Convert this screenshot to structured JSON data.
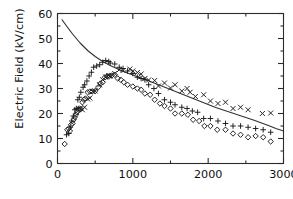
{
  "chart_data": {
    "type": "scatter",
    "title": "",
    "xlabel": "",
    "ylabel": "Electric Field (kV/cm)",
    "xlim": [
      0,
      3000
    ],
    "ylim": [
      0,
      60
    ],
    "xticks": [
      0,
      1000,
      2000,
      3000
    ],
    "xtick_labels": [
      "0",
      "1000",
      "2000",
      "3000"
    ],
    "xminor_ticks": [
      500,
      1500,
      2500
    ],
    "yticks": [
      0,
      10,
      20,
      30,
      40,
      50,
      60
    ],
    "ytick_labels": [
      "0",
      "10",
      "20",
      "30",
      "40",
      "50",
      "60"
    ],
    "yminor_ticks": [
      5,
      15,
      25,
      35,
      45,
      55
    ],
    "grid": false,
    "legend": "none",
    "frame": "box-with-ticks-all-sides",
    "series": [
      {
        "name": "cross-series",
        "marker": "x",
        "color": "#1a1a1a",
        "points": [
          [
            300,
            22.0
          ],
          [
            330,
            21.5
          ],
          [
            360,
            22.5
          ],
          [
            400,
            25.8
          ],
          [
            430,
            26.2
          ],
          [
            470,
            28.8
          ],
          [
            500,
            29.0
          ],
          [
            560,
            31.5
          ],
          [
            600,
            33.5
          ],
          [
            640,
            34.6
          ],
          [
            680,
            35.2
          ],
          [
            700,
            35.0
          ],
          [
            760,
            36.0
          ],
          [
            820,
            37.5
          ],
          [
            870,
            37.2
          ],
          [
            960,
            37.8
          ],
          [
            1000,
            37.0
          ],
          [
            1060,
            36.4
          ],
          [
            1110,
            35.8
          ],
          [
            1160,
            34.0
          ],
          [
            1210,
            33.4
          ],
          [
            1290,
            33.2
          ],
          [
            1340,
            31.0
          ],
          [
            1420,
            32.2
          ],
          [
            1500,
            30.2
          ],
          [
            1560,
            31.5
          ],
          [
            1650,
            29.0
          ],
          [
            1720,
            30.0
          ],
          [
            1760,
            28.5
          ],
          [
            1830,
            26.8
          ],
          [
            1940,
            27.5
          ],
          [
            2030,
            25.0
          ],
          [
            2130,
            24.0
          ],
          [
            2230,
            24.5
          ],
          [
            2330,
            22.0
          ],
          [
            2430,
            22.5
          ],
          [
            2530,
            21.5
          ],
          [
            2720,
            20.0
          ],
          [
            2830,
            20.2
          ]
        ]
      },
      {
        "name": "plus-series",
        "marker": "+",
        "color": "#1a1a1a",
        "points": [
          [
            120,
            11.5
          ],
          [
            150,
            12.0
          ],
          [
            170,
            14.5
          ],
          [
            190,
            17.0
          ],
          [
            210,
            19.0
          ],
          [
            230,
            21.5
          ],
          [
            250,
            22.0
          ],
          [
            270,
            25.5
          ],
          [
            290,
            26.5
          ],
          [
            310,
            28.5
          ],
          [
            340,
            30.5
          ],
          [
            360,
            31.5
          ],
          [
            390,
            33.0
          ],
          [
            420,
            35.0
          ],
          [
            450,
            36.5
          ],
          [
            480,
            38.5
          ],
          [
            520,
            39.0
          ],
          [
            560,
            39.5
          ],
          [
            600,
            40.5
          ],
          [
            640,
            41.2
          ],
          [
            680,
            40.8
          ],
          [
            700,
            40.2
          ],
          [
            760,
            39.8
          ],
          [
            820,
            38.5
          ],
          [
            870,
            38.0
          ],
          [
            930,
            37.0
          ],
          [
            1000,
            36.0
          ],
          [
            1060,
            34.5
          ],
          [
            1110,
            34.0
          ],
          [
            1160,
            33.5
          ],
          [
            1210,
            31.5
          ],
          [
            1280,
            30.0
          ],
          [
            1340,
            28.0
          ],
          [
            1420,
            25.5
          ],
          [
            1500,
            24.5
          ],
          [
            1560,
            23.5
          ],
          [
            1650,
            22.5
          ],
          [
            1720,
            22.0
          ],
          [
            1790,
            21.0
          ],
          [
            1860,
            20.5
          ],
          [
            1940,
            18.0
          ],
          [
            2030,
            18.0
          ],
          [
            2130,
            17.0
          ],
          [
            2230,
            16.0
          ],
          [
            2330,
            15.0
          ],
          [
            2430,
            15.0
          ],
          [
            2530,
            14.5
          ],
          [
            2630,
            14.0
          ],
          [
            2730,
            13.5
          ],
          [
            2830,
            12.5
          ]
        ]
      },
      {
        "name": "diamond-series",
        "marker": "diamond",
        "color": "#1a1a1a",
        "points": [
          [
            95,
            7.8
          ],
          [
            130,
            13.5
          ],
          [
            150,
            14.0
          ],
          [
            165,
            13.0
          ],
          [
            180,
            15.5
          ],
          [
            200,
            16.0
          ],
          [
            215,
            17.5
          ],
          [
            230,
            18.5
          ],
          [
            245,
            19.5
          ],
          [
            260,
            20.5
          ],
          [
            275,
            21.5
          ],
          [
            290,
            22.0
          ],
          [
            310,
            21.8
          ],
          [
            330,
            24.5
          ],
          [
            350,
            25.5
          ],
          [
            370,
            26.0
          ],
          [
            400,
            28.5
          ],
          [
            430,
            28.8
          ],
          [
            460,
            28.8
          ],
          [
            500,
            29.0
          ],
          [
            540,
            30.5
          ],
          [
            570,
            32.0
          ],
          [
            600,
            32.5
          ],
          [
            630,
            34.5
          ],
          [
            660,
            34.8
          ],
          [
            690,
            35.0
          ],
          [
            720,
            35.2
          ],
          [
            760,
            35.5
          ],
          [
            800,
            34.0
          ],
          [
            840,
            33.5
          ],
          [
            880,
            32.5
          ],
          [
            930,
            31.5
          ],
          [
            1000,
            30.8
          ],
          [
            1060,
            30.0
          ],
          [
            1110,
            29.5
          ],
          [
            1160,
            28.0
          ],
          [
            1230,
            27.5
          ],
          [
            1290,
            25.5
          ],
          [
            1360,
            24.0
          ],
          [
            1420,
            23.0
          ],
          [
            1500,
            22.0
          ],
          [
            1560,
            20.0
          ],
          [
            1650,
            20.0
          ],
          [
            1730,
            19.5
          ],
          [
            1800,
            17.5
          ],
          [
            1880,
            17.0
          ],
          [
            1950,
            15.0
          ],
          [
            2030,
            15.0
          ],
          [
            2120,
            13.5
          ],
          [
            2230,
            13.5
          ],
          [
            2330,
            12.0
          ],
          [
            2430,
            11.5
          ],
          [
            2530,
            10.5
          ],
          [
            2630,
            11.0
          ],
          [
            2730,
            10.5
          ],
          [
            2830,
            8.8
          ]
        ]
      }
    ],
    "curve": {
      "name": "model-curve",
      "style": "solid-line",
      "color": "#333333",
      "points": [
        [
          60,
          57.5
        ],
        [
          120,
          55.0
        ],
        [
          200,
          51.8
        ],
        [
          300,
          48.2
        ],
        [
          400,
          45.2
        ],
        [
          500,
          42.8
        ],
        [
          600,
          40.8
        ],
        [
          700,
          39.2
        ],
        [
          800,
          37.8
        ],
        [
          900,
          36.5
        ],
        [
          1000,
          35.4
        ],
        [
          1100,
          34.3
        ],
        [
          1200,
          33.2
        ],
        [
          1300,
          32.0
        ],
        [
          1400,
          30.8
        ],
        [
          1500,
          29.6
        ],
        [
          1600,
          28.4
        ],
        [
          1700,
          27.2
        ],
        [
          1800,
          26.0
        ],
        [
          1900,
          24.8
        ],
        [
          2000,
          23.6
        ],
        [
          2100,
          22.4
        ],
        [
          2200,
          21.4
        ],
        [
          2300,
          20.4
        ],
        [
          2400,
          19.4
        ],
        [
          2500,
          18.4
        ],
        [
          2600,
          17.4
        ],
        [
          2700,
          16.3
        ],
        [
          2800,
          15.2
        ],
        [
          2900,
          14.0
        ],
        [
          3000,
          13.0
        ]
      ]
    }
  }
}
